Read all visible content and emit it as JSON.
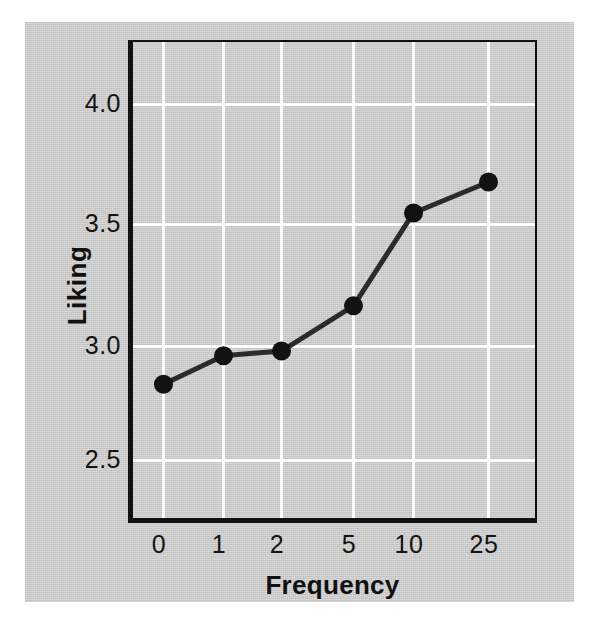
{
  "chart_data": {
    "type": "line",
    "title": "",
    "xlabel": "Frequency",
    "ylabel": "Liking",
    "categories": [
      "0",
      "1",
      "2",
      "5",
      "10",
      "25"
    ],
    "values": [
      2.82,
      2.94,
      2.96,
      3.15,
      3.54,
      3.67
    ],
    "series": [
      {
        "name": "Liking",
        "values": [
          2.82,
          2.94,
          2.96,
          3.15,
          3.54,
          3.67
        ]
      }
    ],
    "ylim": [
      2.3,
      4.25
    ],
    "ytick_labels": [
      "4.0",
      "3.5",
      "3.0",
      "2.5"
    ],
    "ytick_values": [
      4.0,
      3.5,
      3.0,
      2.5
    ],
    "xtick_labels": [
      "0",
      "1",
      "2",
      "5",
      "10",
      "25"
    ],
    "grid": true,
    "grid_color": "#ffffff",
    "legend": null,
    "legend_position": "none",
    "line_color": "#2b2b2b",
    "marker": "circle",
    "marker_color": "#121212",
    "plot_background": "#c9c9c9",
    "axis_color": "#111111",
    "x_axis_type": "categorical"
  },
  "figure": {
    "background_color": "#c9c9c9",
    "page_background": "#ffffff"
  }
}
